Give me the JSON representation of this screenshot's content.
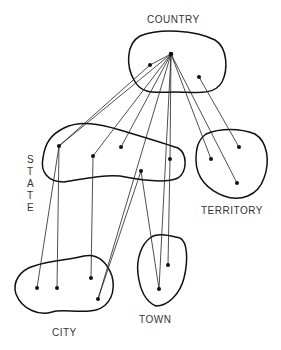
{
  "labels": {
    "country": "COUNTRY",
    "state": [
      "S",
      "T",
      "A",
      "T",
      "E"
    ],
    "territory": "TERRITORY",
    "city": "CITY",
    "town": "TOWN"
  },
  "nodes": {
    "country_center": [
      171,
      54
    ],
    "country": [
      [
        150,
        65
      ],
      [
        199,
        77
      ]
    ],
    "state": [
      [
        59,
        146
      ],
      [
        93,
        156
      ],
      [
        121,
        147
      ],
      [
        170,
        159
      ],
      [
        141,
        171
      ]
    ],
    "territory": [
      [
        211,
        159
      ],
      [
        239,
        147
      ],
      [
        237,
        183
      ]
    ],
    "city": [
      [
        37,
        288
      ],
      [
        57,
        288
      ],
      [
        91,
        278
      ],
      [
        98,
        299
      ]
    ],
    "town": [
      [
        159,
        289
      ],
      [
        168,
        265
      ]
    ]
  }
}
